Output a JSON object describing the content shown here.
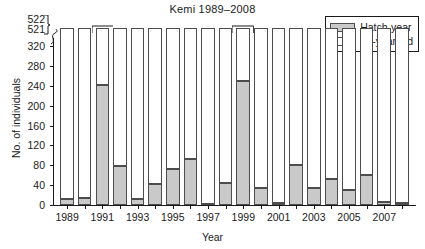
{
  "chart_data": {
    "type": "bar",
    "stacked": true,
    "title": "Kemi 1989–2008",
    "xlabel": "Year",
    "ylabel": "No. of individuals",
    "grid": false,
    "legend_position": "top-right",
    "ylim": [
      0,
      322
    ],
    "y_ticks": [
      0,
      40,
      80,
      120,
      160,
      200,
      240,
      280,
      320
    ],
    "y_axis_break": {
      "present": true,
      "labels_above_break": [
        521,
        522
      ],
      "note": "1991 bar is truncated; bracket marks value beyond axis"
    },
    "x_tick_labels": [
      "1989",
      "1991",
      "1993",
      "1995",
      "1997",
      "1999",
      "2001",
      "2003",
      "2005",
      "2007"
    ],
    "categories": [
      "1989",
      "1990",
      "1991",
      "1992",
      "1993",
      "1994",
      "1995",
      "1996",
      "1997",
      "1998",
      "1999",
      "2000",
      "2001",
      "2002",
      "2003",
      "2004",
      "2005",
      "2006",
      "2007",
      "2008"
    ],
    "series": [
      {
        "name": "Hatch-year",
        "color": "#c9c9c9",
        "values": [
          12,
          14,
          241,
          78,
          12,
          43,
          72,
          93,
          2,
          44,
          250,
          35,
          5,
          81,
          34,
          52,
          31,
          61,
          7,
          4
        ]
      },
      {
        "name": "+1-year old",
        "color": "#ffffff",
        "values": [
          29,
          55,
          281,
          76,
          64,
          47,
          35,
          54,
          44,
          57,
          72,
          103,
          40,
          45,
          40,
          21,
          61,
          30,
          9,
          38
        ]
      }
    ],
    "totals": [
      41,
      69,
      522,
      154,
      76,
      90,
      107,
      147,
      46,
      101,
      322,
      138,
      45,
      126,
      74,
      73,
      92,
      91,
      16,
      42
    ]
  },
  "legend": {
    "items": [
      {
        "label": "Hatch-year",
        "swatch": "gray-filled-rect"
      },
      {
        "label": "+1-year old",
        "swatch": "white-filled-rect"
      }
    ]
  },
  "axis_break_labels": {
    "upper": "522",
    "lower": "521"
  }
}
